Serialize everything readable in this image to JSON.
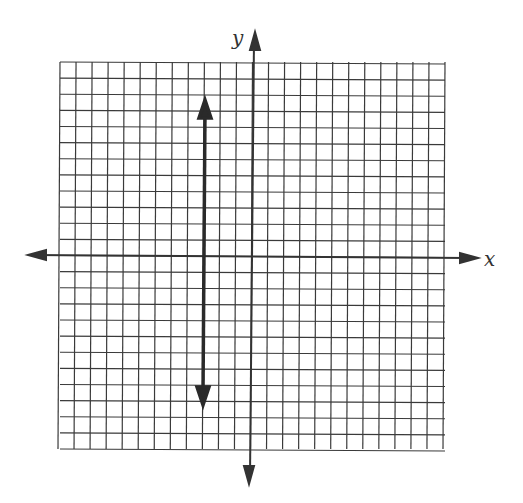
{
  "figure": {
    "type": "coordinate-grid",
    "x_axis_label": "x",
    "y_axis_label": "y",
    "grid_cells_x": 24,
    "grid_cells_y": 24,
    "origin_cell": {
      "col": 12,
      "row": 12
    },
    "line": {
      "kind": "vertical",
      "x_value": -3,
      "arrows": "both",
      "y_top": 9.5,
      "y_bottom": -9
    },
    "colors": {
      "grid": "#3a3a3a",
      "line": "#2a2a2a"
    }
  }
}
